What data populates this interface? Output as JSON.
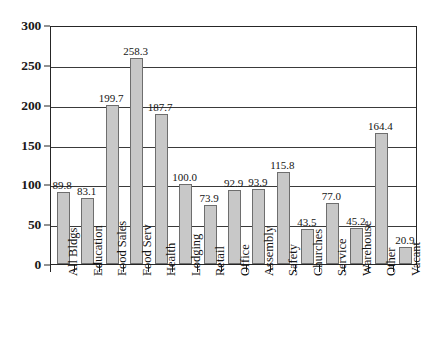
{
  "chart_data": {
    "type": "bar",
    "title": "",
    "subtitle": "",
    "xlabel": "",
    "ylabel": "",
    "ylim": [
      0,
      300
    ],
    "yticks": [
      0,
      50,
      100,
      150,
      200,
      250,
      300
    ],
    "ytick_labels": [
      "0",
      "50",
      "100",
      "150",
      "200",
      "250",
      "300"
    ],
    "grid": "horizontal",
    "legend": "none",
    "bar_color": "#c8c8c8",
    "bar_border_color": "#6e6e6e",
    "categories": [
      "All Bldgs",
      "Education",
      "Food Sales",
      "Food Serv",
      "Health",
      "Lodging",
      "Retail",
      "Office",
      "Assembly",
      "Safety",
      "Churches",
      "Service",
      "Warehouse",
      "Other",
      "Vacant"
    ],
    "values": [
      89.8,
      83.1,
      199.7,
      258.3,
      187.7,
      100.0,
      73.9,
      92.9,
      93.9,
      115.8,
      43.5,
      77.0,
      45.2,
      164.4,
      20.9
    ],
    "value_labels": [
      "89.8",
      "83.1",
      "199.7",
      "258.3",
      "187.7",
      "100.0",
      "73.9",
      "92.9",
      "93.9",
      "115.8",
      "43.5",
      "77.0",
      "45.2",
      "164.4",
      "20.9"
    ]
  }
}
